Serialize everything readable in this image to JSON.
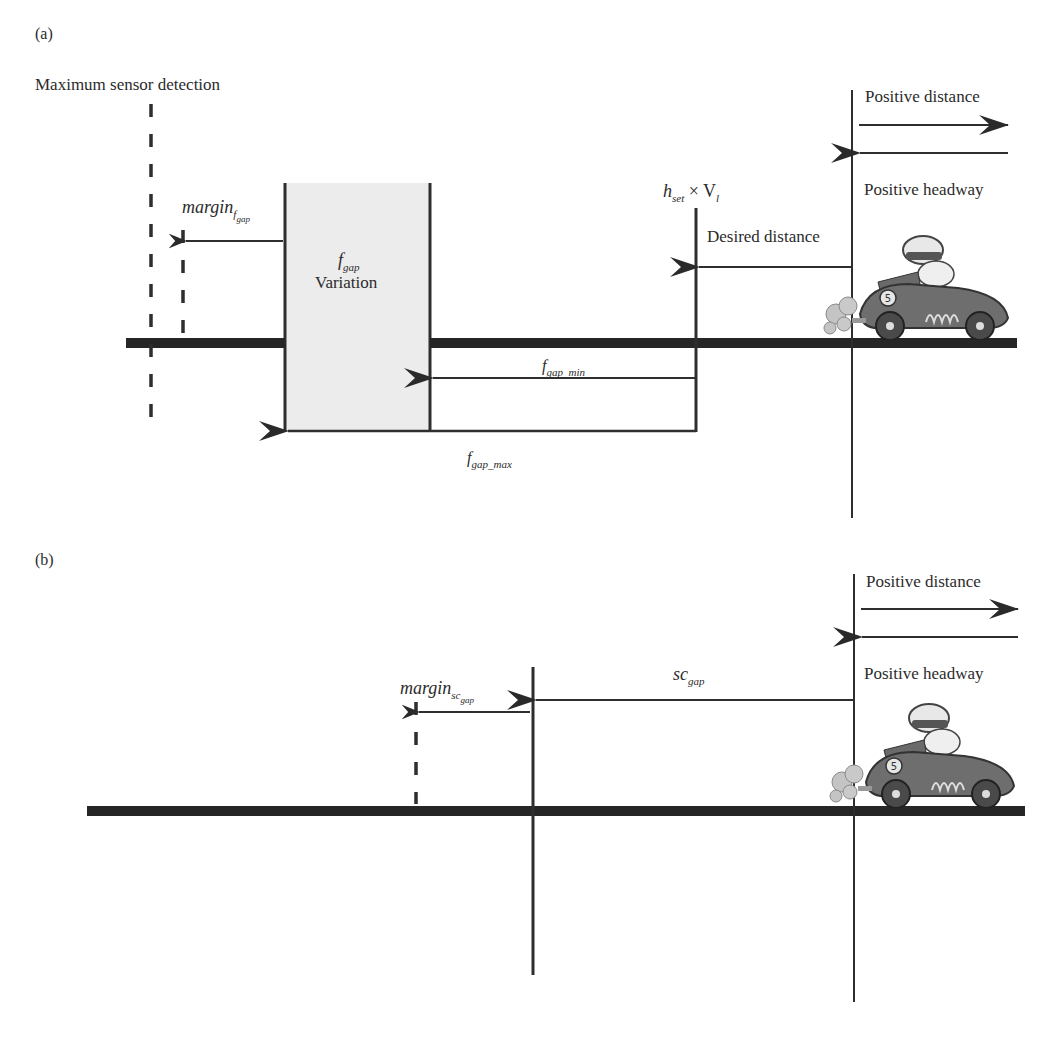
{
  "panel_a": {
    "label": "(a)",
    "max_sensor_label": "Maximum sensor detection",
    "margin_label": "margin",
    "margin_sub": "f",
    "margin_subsub": "gap",
    "fgap_label": "f",
    "fgap_sub": "gap",
    "variation_label": "Variation",
    "hset_label_h": "h",
    "hset_label_sub": "set",
    "hset_label_times": " × V",
    "hset_label_vsub": "l",
    "desired_distance_label": "Desired distance",
    "fgap_min_label": "f",
    "fgap_min_sub": "gap_min",
    "fgap_max_label": "f",
    "fgap_max_sub": "gap_max",
    "positive_distance_label": "Positive distance",
    "positive_headway_label": "Positive headway"
  },
  "panel_b": {
    "label": "(b)",
    "margin_label": "margin",
    "margin_sub": "sc",
    "margin_subsub": "gap",
    "scgap_label": "sc",
    "scgap_sub": "gap",
    "positive_distance_label": "Positive distance",
    "positive_headway_label": "Positive headway"
  },
  "colors": {
    "line": "#2e2e2e",
    "road": "#262626",
    "box_fill": "#ececec",
    "car_body": "#6e6e6e",
    "smoke": "#bdbdbd"
  }
}
